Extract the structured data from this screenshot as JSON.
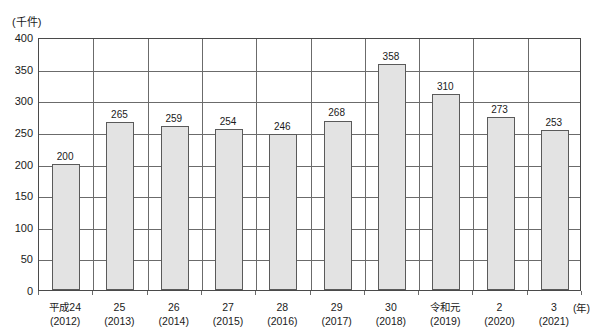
{
  "chart_data": {
    "type": "bar",
    "title": "",
    "subtitle": "",
    "xlabel": "(年)",
    "ylabel": "(千件)",
    "ylim": [
      0,
      400
    ],
    "ytick_step": 50,
    "yticks": [
      "0",
      "50",
      "100",
      "150",
      "200",
      "250",
      "300",
      "350",
      "400"
    ],
    "grid": true,
    "legend": "none",
    "categories": [
      "平成24\n(2012)",
      "25\n(2013)",
      "26\n(2014)",
      "27\n(2015)",
      "28\n(2016)",
      "29\n(2017)",
      "30\n(2018)",
      "令和元\n(2019)",
      "2\n(2020)",
      "3\n(2021)"
    ],
    "category_labels": [
      {
        "era": "平成24",
        "year": "(2012)"
      },
      {
        "era": "25",
        "year": "(2013)"
      },
      {
        "era": "26",
        "year": "(2014)"
      },
      {
        "era": "27",
        "year": "(2015)"
      },
      {
        "era": "28",
        "year": "(2016)"
      },
      {
        "era": "29",
        "year": "(2017)"
      },
      {
        "era": "30",
        "year": "(2018)"
      },
      {
        "era": "令和元",
        "year": "(2019)"
      },
      {
        "era": "2",
        "year": "(2020)"
      },
      {
        "era": "3",
        "year": "(2021)"
      }
    ],
    "values": [
      200,
      265,
      259,
      254,
      246,
      268,
      358,
      310,
      273,
      253
    ],
    "value_labels": [
      "200",
      "265",
      "259",
      "254",
      "246",
      "268",
      "358",
      "310",
      "273",
      "253"
    ],
    "colors": {
      "bar_fill": "#e3e3e3",
      "bar_border": "#5a5a5a",
      "gridline": "#6b6b6b",
      "axis": "#4a4a4a",
      "text": "#1a1a1a",
      "background": "#ffffff"
    }
  }
}
